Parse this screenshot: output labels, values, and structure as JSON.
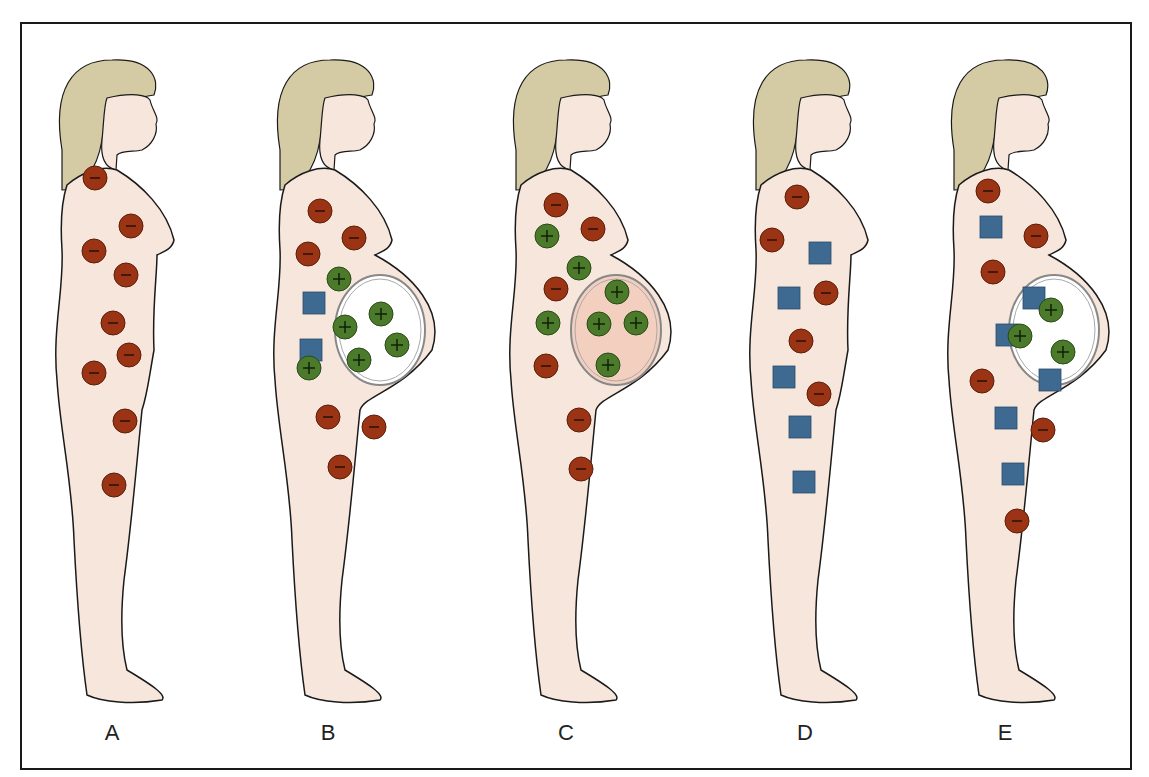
{
  "figure": {
    "colors": {
      "skin": "#f7e6dc",
      "hair": "#d4cba5",
      "outline": "#1a1a1a",
      "negative_marker": "#9b3414",
      "positive_marker": "#4a7a2a",
      "square_marker": "#3e6a92",
      "uterus_fill_white": "#ffffff",
      "uterus_fill_pink": "#f3cfc0"
    },
    "panels": [
      {
        "id": "A",
        "label": "A",
        "x": 112,
        "negatives": [
          [
            95,
            178
          ],
          [
            131,
            226
          ],
          [
            94,
            251
          ],
          [
            126,
            275
          ],
          [
            113,
            323
          ],
          [
            129,
            355
          ],
          [
            94,
            373
          ],
          [
            125,
            421
          ],
          [
            114,
            485
          ]
        ],
        "positives": [],
        "squares": [],
        "pregnant": false
      },
      {
        "id": "B",
        "label": "B",
        "x": 330,
        "negatives": [
          [
            320,
            211
          ],
          [
            354,
            238
          ],
          [
            308,
            254
          ],
          [
            328,
            417
          ],
          [
            374,
            427
          ],
          [
            340,
            467
          ]
        ],
        "positives": [
          [
            339,
            279
          ],
          [
            309,
            368
          ],
          [
            345,
            327
          ],
          [
            381,
            314
          ],
          [
            397,
            345
          ],
          [
            359,
            360
          ]
        ],
        "squares": [
          [
            314,
            303
          ],
          [
            311,
            350
          ]
        ],
        "pregnant": true,
        "uterus_fill": "white"
      },
      {
        "id": "C",
        "label": "C",
        "x": 566,
        "negatives": [
          [
            556,
            205
          ],
          [
            593,
            229
          ],
          [
            556,
            289
          ],
          [
            546,
            366
          ],
          [
            579,
            420
          ],
          [
            581,
            469
          ]
        ],
        "positives": [
          [
            547,
            236
          ],
          [
            579,
            268
          ],
          [
            617,
            292
          ],
          [
            548,
            323
          ],
          [
            599,
            324
          ],
          [
            636,
            323
          ],
          [
            608,
            365
          ]
        ],
        "squares": [],
        "pregnant": true,
        "uterus_fill": "pink"
      },
      {
        "id": "D",
        "label": "D",
        "x": 806,
        "negatives": [
          [
            797,
            197
          ],
          [
            772,
            240
          ],
          [
            826,
            293
          ],
          [
            801,
            341
          ],
          [
            819,
            394
          ]
        ],
        "positives": [],
        "squares": [
          [
            820,
            253
          ],
          [
            789,
            298
          ],
          [
            784,
            377
          ],
          [
            800,
            427
          ],
          [
            804,
            482
          ]
        ],
        "pregnant": false
      },
      {
        "id": "E",
        "label": "E",
        "x": 1004,
        "negatives": [
          [
            988,
            191
          ],
          [
            1036,
            236
          ],
          [
            993,
            272
          ],
          [
            982,
            381
          ],
          [
            1043,
            430
          ],
          [
            1017,
            521
          ]
        ],
        "positives": [
          [
            1051,
            310
          ],
          [
            1020,
            336
          ],
          [
            1063,
            352
          ]
        ],
        "squares": [
          [
            991,
            227
          ],
          [
            1034,
            298
          ],
          [
            1007,
            335
          ],
          [
            1050,
            380
          ],
          [
            1006,
            418
          ],
          [
            1013,
            474
          ]
        ],
        "pregnant": true,
        "uterus_fill": "white"
      }
    ]
  },
  "labels": {
    "a": "A",
    "b": "B",
    "c": "C",
    "d": "D",
    "e": "E"
  }
}
